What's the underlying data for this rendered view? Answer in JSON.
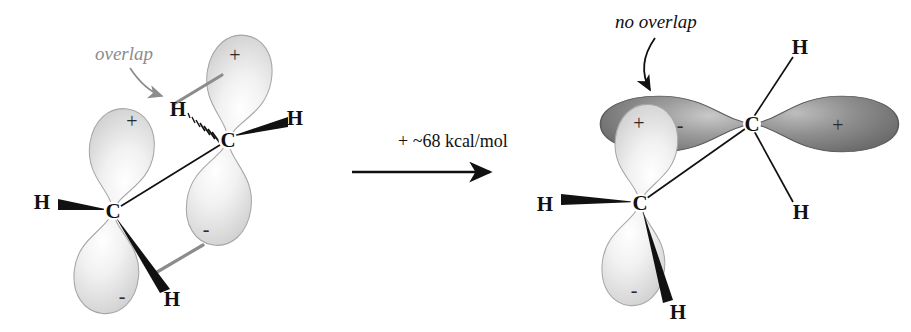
{
  "figure": {
    "type": "chemical-structure-diagram",
    "background_color": "#ffffff"
  },
  "reaction": {
    "energy_label": "+ ~68 kcal/mol",
    "energy_value": 68,
    "energy_units": "kcal/mol",
    "energy_approx_symbol": "~",
    "arrow_name": "reaction-arrow"
  },
  "left_structure": {
    "name": "planar-alkene-with-p-orbital-overlap",
    "annotation": {
      "text": "overlap",
      "color": "#8c8c8c",
      "arrow_color": "#8c8c8c"
    },
    "atoms": [
      {
        "id": "c-top",
        "label": "C",
        "x": 228,
        "y": 140
      },
      {
        "id": "c-bottom",
        "label": "C",
        "x": 113,
        "y": 211
      }
    ],
    "hydrogens": [
      {
        "id": "h-top-right",
        "label": "H",
        "x": 295,
        "y": 118,
        "bond": "wedge"
      },
      {
        "id": "h-top-left",
        "label": "H",
        "x": 178,
        "y": 109,
        "bond": "hash"
      },
      {
        "id": "h-bottom-left",
        "label": "H",
        "x": 42,
        "y": 202,
        "bond": "wedge"
      },
      {
        "id": "h-bottom-right",
        "label": "H",
        "x": 172,
        "y": 299,
        "bond": "wedge"
      }
    ],
    "orbitals": [
      {
        "id": "lobe-top-upper",
        "sign": "+",
        "shade": "light"
      },
      {
        "id": "lobe-top-lower",
        "sign": "-",
        "shade": "light"
      },
      {
        "id": "lobe-bottom-upper",
        "sign": "+",
        "shade": "light"
      },
      {
        "id": "lobe-bottom-lower",
        "sign": "-",
        "shade": "light"
      }
    ],
    "overlap_links": [
      {
        "id": "overlap-link-plus",
        "color": "#8c8c8c"
      },
      {
        "id": "overlap-link-minus",
        "color": "#8c8c8c"
      }
    ]
  },
  "right_structure": {
    "name": "twisted-alkene-with-no-p-orbital-overlap",
    "annotation": {
      "text": "no overlap",
      "color": "#111111",
      "arrow_color": "#111111"
    },
    "atoms": [
      {
        "id": "c-right",
        "label": "C",
        "x": 752,
        "y": 124
      },
      {
        "id": "c-left",
        "label": "C",
        "x": 640,
        "y": 203
      }
    ],
    "hydrogens": [
      {
        "id": "h-upper-right",
        "label": "H",
        "x": 795,
        "y": 48,
        "bond": "line"
      },
      {
        "id": "h-lower-right",
        "label": "H",
        "x": 797,
        "y": 212,
        "bond": "line"
      },
      {
        "id": "h-left",
        "label": "H",
        "x": 545,
        "y": 204,
        "bond": "wedge"
      },
      {
        "id": "h-bottom",
        "label": "H",
        "x": 675,
        "y": 312,
        "bond": "wedge"
      }
    ],
    "orbitals": [
      {
        "id": "lobe-right-back",
        "sign": "-",
        "shade": "dark"
      },
      {
        "id": "lobe-right-front",
        "sign": "+",
        "shade": "dark"
      },
      {
        "id": "lobe-left-upper",
        "sign": "+",
        "shade": "light"
      },
      {
        "id": "lobe-left-lower",
        "sign": "-",
        "shade": "light"
      }
    ]
  },
  "colors": {
    "orbital_light_fill": "#ededed",
    "orbital_light_edge": "#9a9a9a",
    "orbital_dark_fill": "#8f8f8f",
    "orbital_dark_edge": "#4f4f4f",
    "bond_black": "#111111",
    "overlap_gray": "#8c8c8c"
  }
}
